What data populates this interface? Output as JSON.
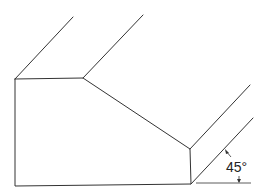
{
  "diagram": {
    "type": "isometric chamfered block",
    "annotation": {
      "angle_label": "45°"
    },
    "colors": {
      "line": "#333333",
      "background": "#ffffff"
    }
  }
}
